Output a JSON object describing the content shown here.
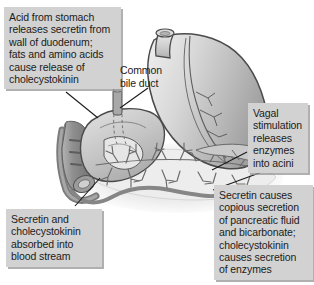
{
  "figure": {
    "style": "grayscale line illustration",
    "width_px": 314,
    "height_px": 285,
    "background_color": "#ffffff"
  },
  "colors": {
    "callout_fill": "#d2d2d2",
    "callout_shadow": "#969696",
    "text": "#1b1b1b",
    "organ_outline": "#4a4a4a",
    "organ_fill_light": "#d9d9d9",
    "organ_fill_mid": "#c2c2c2",
    "organ_fill_dark": "#a9a9a9",
    "vessel": "#8c8c8c",
    "pancreas_halo": "#ededed",
    "leader_line": "#1b1b1b"
  },
  "callouts": [
    {
      "id": "acid",
      "text": "Acid from stomach\nreleases secretin from\nwall of duodenum;\nfats and amino acids\ncause release of\ncholecystokinin",
      "points_to": "duodenum"
    },
    {
      "id": "vagal",
      "text": "Vagal\nstimulation\nreleases\nenzymes\ninto acini",
      "points_to": "pancreatic-acini"
    },
    {
      "id": "secretin-absorbed",
      "text": "Secretin and\ncholecystokinin\nabsorbed into\nblood stream",
      "points_to": "blood-vessel"
    },
    {
      "id": "secretin-causes",
      "text": "Secretin causes\ncopious secretion\nof pancreatic fluid\nand bicarbonate;\ncholecystokinin\ncauses secretion\nof enzymes",
      "points_to": "pancreas"
    }
  ],
  "labels": [
    {
      "id": "common-bile-duct",
      "text": "Common\nbile duct",
      "points_to": "bile-duct-structure"
    }
  ],
  "anatomy": [
    {
      "name": "esophagus",
      "label": "Esophagus"
    },
    {
      "name": "stomach",
      "label": "Stomach"
    },
    {
      "name": "duodenum",
      "label": "Duodenum"
    },
    {
      "name": "common-bile-duct",
      "label": "Common bile duct"
    },
    {
      "name": "pancreas",
      "label": "Pancreas"
    },
    {
      "name": "pancreatic-duct",
      "label": "Pancreatic duct"
    },
    {
      "name": "blood-vessel",
      "label": "Blood vessel"
    }
  ]
}
